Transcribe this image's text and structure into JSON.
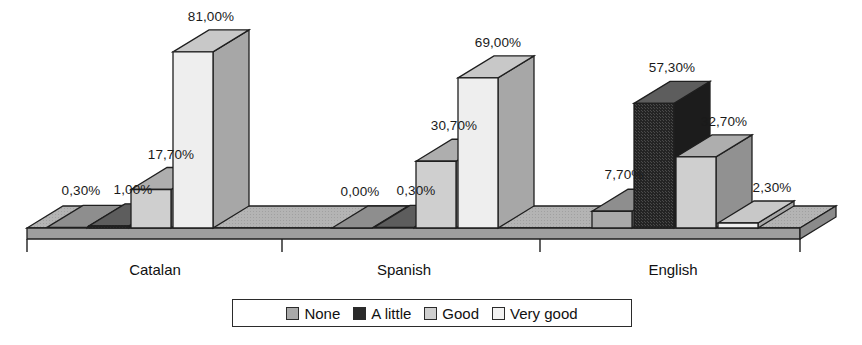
{
  "chart_data": {
    "type": "bar",
    "title": "",
    "subtitle": "",
    "xlabel": "",
    "ylabel": "",
    "grid": false,
    "legend_position": "bottom",
    "value_label_format": "comma-decimal-percent",
    "ylim": [
      0,
      90
    ],
    "categories": [
      "Catalan",
      "Spanish",
      "English"
    ],
    "series": [
      {
        "name": "None",
        "values": [
          0.3,
          0.0,
          7.7
        ],
        "labels": [
          "0,30%",
          "0,00%",
          "7,70%"
        ],
        "color": "#a9a9a9"
      },
      {
        "name": "A little",
        "values": [
          1.0,
          0.3,
          57.3
        ],
        "labels": [
          "1,00%",
          "0,30%",
          "57,30%"
        ],
        "color": "#2a2a2a"
      },
      {
        "name": "Good",
        "values": [
          17.7,
          30.7,
          32.7
        ],
        "labels": [
          "17,70%",
          "30,70%",
          "32,70%"
        ],
        "color": "#cfcfcf"
      },
      {
        "name": "Very good",
        "values": [
          81.0,
          69.0,
          2.3
        ],
        "labels": [
          "81,00%",
          "69,00%",
          "2,30%"
        ],
        "color": "#eeeeee"
      }
    ]
  },
  "legend": {
    "items": [
      {
        "label": "None",
        "color": "#a9a9a9"
      },
      {
        "label": "A little",
        "color": "#2a2a2a"
      },
      {
        "label": "Good",
        "color": "#cfcfcf"
      },
      {
        "label": "Very good",
        "color": "#f2f2f2"
      }
    ]
  },
  "axis": {
    "category_labels": [
      "Catalan",
      "Spanish",
      "English"
    ],
    "tick_count": 4
  },
  "colors": {
    "floor_top": "#b4b4b4",
    "floor_front": "#9e9e9e",
    "outline": "#1f1f1f",
    "background": "#ffffff",
    "bar_none_front": "#a9a9a9",
    "bar_alittle_front": "#2a2a2a",
    "bar_good_front": "#cfcfcf",
    "bar_verygood_front": "#eeeeee"
  }
}
